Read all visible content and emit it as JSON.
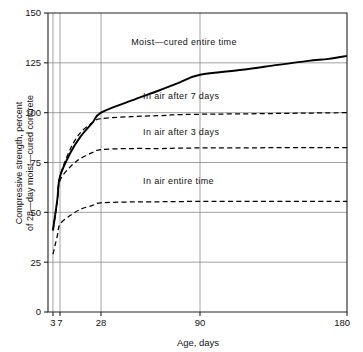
{
  "chart_data": {
    "type": "line",
    "title": "",
    "xlabel": "Age, days",
    "ylabel": "Compressive strength, percent of 28-day moist-cured concrete",
    "ylabel_line1": "Compressive strength, percent",
    "ylabel_line2": "of 28—day moist—cured concrete",
    "x_tick_labels": [
      "3",
      "7",
      "28",
      "90",
      "180"
    ],
    "x_ticks": [
      3,
      7,
      28,
      90,
      180
    ],
    "y_tick_labels": [
      "0",
      "25",
      "50",
      "75",
      "100",
      "125",
      "150"
    ],
    "y_ticks": [
      0,
      25,
      50,
      75,
      100,
      125,
      150
    ],
    "xlim": [
      3,
      180
    ],
    "ylim": [
      0,
      150
    ],
    "grid": true,
    "legend": "inline-annotations",
    "x_scale": "compressed-age",
    "series": [
      {
        "name": "Moist-cured entire time",
        "label": "Moist—cured entire time",
        "style": "solid",
        "color": "#000000",
        "x": [
          3,
          5,
          7,
          10,
          14,
          21,
          28,
          40,
          55,
          70,
          90,
          110,
          130,
          150,
          165,
          180
        ],
        "values": [
          41,
          56,
          68,
          80,
          88,
          95,
          100,
          106,
          111,
          115,
          119,
          121.5,
          124,
          126,
          127,
          128.5
        ]
      },
      {
        "name": "In air after 7 days",
        "label": "In air after 7 days",
        "style": "dashed",
        "color": "#000000",
        "x": [
          3,
          5,
          7,
          10,
          14,
          21,
          28,
          40,
          55,
          70,
          90,
          120,
          150,
          180
        ],
        "values": [
          41,
          56,
          68,
          82,
          90,
          95,
          97,
          98,
          98.5,
          99,
          99.2,
          99.5,
          99.8,
          100
        ]
      },
      {
        "name": "In air after 3 days",
        "label": "In air after 3 days",
        "style": "dashed",
        "color": "#000000",
        "x": [
          3,
          5,
          7,
          10,
          14,
          21,
          28,
          40,
          55,
          70,
          90,
          120,
          150,
          180
        ],
        "values": [
          41,
          56,
          66,
          73,
          77,
          80,
          81.5,
          82,
          82,
          82.2,
          82.3,
          82.4,
          82.5,
          82.5
        ]
      },
      {
        "name": "In air entire time",
        "label": "In air entire time",
        "style": "dashed",
        "color": "#000000",
        "x": [
          3,
          5,
          7,
          10,
          14,
          21,
          28,
          40,
          55,
          70,
          90,
          120,
          150,
          180
        ],
        "values": [
          29,
          38,
          44,
          48.5,
          51.5,
          53.5,
          54.8,
          55.2,
          55.3,
          55.4,
          55.5,
          55.5,
          55.5,
          55.5
        ]
      }
    ],
    "annotations": [
      {
        "text": "Moist—cured entire time",
        "x": 40,
        "y": 134
      },
      {
        "text": "In air after 7 days",
        "x": 46,
        "y": 107
      },
      {
        "text": "In air after 3 days",
        "x": 46,
        "y": 89
      },
      {
        "text": "In air entire time",
        "x": 46,
        "y": 64
      }
    ]
  },
  "colors": {
    "axis": "#222222",
    "grid": "#8a8a8a",
    "curve": "#000000",
    "background": "#ffffff"
  }
}
